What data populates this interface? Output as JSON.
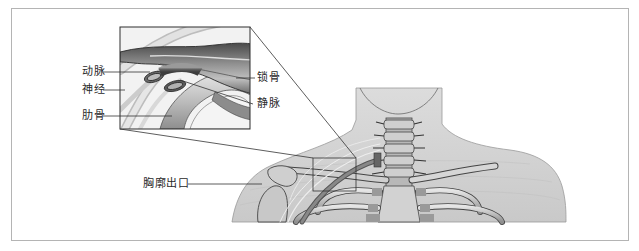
{
  "figure": {
    "type": "anatomical-illustration",
    "inset_labels_left": [
      {
        "id": "artery",
        "text": "动脉"
      },
      {
        "id": "nerve",
        "text": "神经"
      },
      {
        "id": "rib",
        "text": "肋骨"
      }
    ],
    "inset_labels_right": [
      {
        "id": "clavicle",
        "text": "锁骨"
      },
      {
        "id": "vein",
        "text": "静脉"
      }
    ],
    "main_label": {
      "id": "thoracic-outlet",
      "text": "胸廓出口"
    },
    "colors": {
      "frame_border": "#b4b4b4",
      "skin": "#d6d6d6",
      "bone": "#c4c4c4",
      "bone_dark": "#8a8a8a",
      "outline": "#3a3a3a",
      "leader_line": "#333333",
      "text": "#2a2a2a"
    }
  }
}
